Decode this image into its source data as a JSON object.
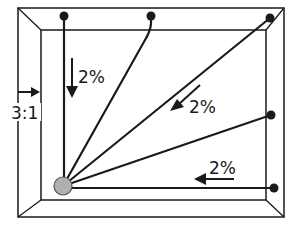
{
  "diagram": {
    "title": "",
    "frame": {
      "outer": {
        "x1": 18,
        "y1": 8,
        "x2": 284,
        "y2": 217
      },
      "inner": {
        "x1": 41,
        "y1": 30,
        "x2": 266,
        "y2": 200
      }
    },
    "hub": {
      "x": 63,
      "y": 186,
      "r": 9,
      "fill": "#b0b0b0"
    },
    "lines": [
      {
        "id": "line-top-left",
        "end": {
          "x": 64,
          "y": 16
        }
      },
      {
        "id": "line-top-mid",
        "end": {
          "x": 151,
          "y": 16
        },
        "curved": true
      },
      {
        "id": "line-top-right",
        "end": {
          "x": 270,
          "y": 18
        }
      },
      {
        "id": "line-right-mid",
        "end": {
          "x": 271,
          "y": 115
        }
      },
      {
        "id": "line-bottom",
        "end": {
          "x": 273,
          "y": 188
        }
      }
    ],
    "labels": {
      "slope_left": "2%",
      "slope_diagonal": "2%",
      "slope_bottom": "2%",
      "side_slope": "3:1"
    },
    "colors": {
      "stroke": "#1a1a1a",
      "hub": "#b0b0b0",
      "background": "#ffffff"
    }
  }
}
